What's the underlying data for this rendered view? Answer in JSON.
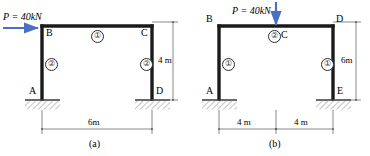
{
  "figures": [
    {
      "caption": "(a)",
      "load": {
        "symbol": "P",
        "equals": "=",
        "magnitude": "40",
        "unit": "kN",
        "full": "P = 40kN",
        "direction": "horizontal-right",
        "applied_at": "B",
        "color": "#4a6fc4"
      },
      "joints": [
        {
          "name": "A",
          "label": "A"
        },
        {
          "name": "B",
          "label": "B"
        },
        {
          "name": "C",
          "label": "C"
        },
        {
          "name": "D",
          "label": "D"
        }
      ],
      "members": [
        {
          "tag": "1",
          "label": "①",
          "location": "beam-BC"
        },
        {
          "tag": "2",
          "label": "②",
          "location": "column-AB"
        },
        {
          "tag": "2b",
          "label": "②",
          "location": "column-CD"
        }
      ],
      "dimensions": [
        {
          "name": "span",
          "label": "6m",
          "orientation": "horizontal"
        },
        {
          "name": "height",
          "label": "4 m",
          "orientation": "vertical"
        }
      ],
      "supports": [
        {
          "at": "A",
          "type": "fixed"
        },
        {
          "at": "D",
          "type": "fixed"
        }
      ]
    },
    {
      "caption": "(b)",
      "load": {
        "symbol": "P",
        "equals": "=",
        "magnitude": "40",
        "unit": "kN",
        "full": "P = 40kN",
        "direction": "vertical-down",
        "applied_at": "C",
        "color": "#4a6fc4"
      },
      "joints": [
        {
          "name": "A",
          "label": "A"
        },
        {
          "name": "B",
          "label": "B"
        },
        {
          "name": "C",
          "label": "C"
        },
        {
          "name": "D",
          "label": "D"
        },
        {
          "name": "E",
          "label": "E"
        }
      ],
      "members": [
        {
          "tag": "2",
          "label": "②",
          "location": "beam-BD"
        },
        {
          "tag": "1",
          "label": "①",
          "location": "column-AB"
        },
        {
          "tag": "1b",
          "label": "①",
          "location": "column-DE"
        }
      ],
      "dimensions": [
        {
          "name": "span-left",
          "label": "4 m",
          "orientation": "horizontal"
        },
        {
          "name": "span-right",
          "label": "4 m",
          "orientation": "horizontal"
        },
        {
          "name": "height",
          "label": "6m",
          "orientation": "vertical"
        }
      ],
      "supports": [
        {
          "at": "A",
          "type": "fixed"
        },
        {
          "at": "E",
          "type": "fixed"
        }
      ]
    }
  ],
  "style": {
    "member_color": "#1a1a1a",
    "dimension_color": "#6b6b6b",
    "hatch_color": "#7a7a7a",
    "load_color": "#4a6fc4"
  }
}
